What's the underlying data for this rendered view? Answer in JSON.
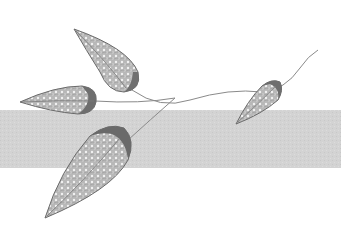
{
  "illustration": {
    "subject": "decorative branch with four filigree leaves",
    "colors": {
      "background": "#ffffff",
      "band": "#d4d4d4",
      "leaf_fill": "#bdbdbd",
      "leaf_outline": "#6a6a6a",
      "leaf_shadow": "#7a7a7a",
      "stem": "#8a8a8a"
    },
    "band": {
      "top": 110,
      "height": 58
    },
    "leaves": [
      {
        "name": "top-left-leaf",
        "tip": [
          74,
          29
        ],
        "base": [
          135,
          90
        ]
      },
      {
        "name": "left-leaf",
        "tip": [
          20,
          102
        ],
        "base": [
          95,
          100
        ]
      },
      {
        "name": "bottom-leaf",
        "tip": [
          45,
          218
        ],
        "base": [
          128,
          140
        ]
      },
      {
        "name": "right-leaf",
        "tip": [
          236,
          124
        ],
        "base": [
          278,
          86
        ]
      }
    ]
  }
}
